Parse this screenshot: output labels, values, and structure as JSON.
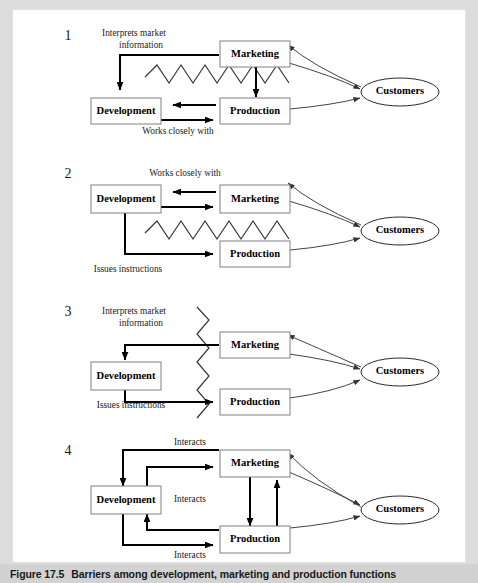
{
  "figure": {
    "caption_number": "Figure 17.5",
    "caption_title": "Barriers among development, marketing and production functions",
    "background": "#dcdcdc",
    "canvas_background": "#ffffff"
  },
  "nodes": {
    "development": "Development",
    "marketing": "Marketing",
    "production": "Production",
    "customers": "Customers"
  },
  "panels": [
    {
      "number": "1",
      "annotations": {
        "top_left_line1": "Interprets market",
        "top_left_line2": "information",
        "bottom": "Works closely with"
      },
      "barrier": "horizontal-zigzag",
      "boxes": [
        "Marketing",
        "Development",
        "Production",
        "Customers"
      ]
    },
    {
      "number": "2",
      "annotations": {
        "top": "Works closely with",
        "bottom_left": "Issues instructions"
      },
      "barrier": "horizontal-zigzag",
      "boxes": [
        "Development",
        "Marketing",
        "Production",
        "Customers"
      ]
    },
    {
      "number": "3",
      "annotations": {
        "top_left_line1": "Interprets market",
        "top_left_line2": "information",
        "bottom_left": "Issues instructions"
      },
      "barrier": "vertical-zigzag",
      "boxes": [
        "Development",
        "Marketing",
        "Production",
        "Customers"
      ]
    },
    {
      "number": "4",
      "annotations": {
        "top": "Interacts",
        "middle": "Interacts",
        "bottom": "Interacts"
      },
      "barrier": "none",
      "boxes": [
        "Development",
        "Marketing",
        "Production",
        "Customers"
      ]
    }
  ],
  "colors": {
    "box_stroke": "#808080",
    "flow_arrow": "#000000",
    "customer_arrow": "#444444",
    "zigzag": "#333333",
    "caption_bar": "#d2d2d2",
    "text": "#1a1a1a"
  }
}
